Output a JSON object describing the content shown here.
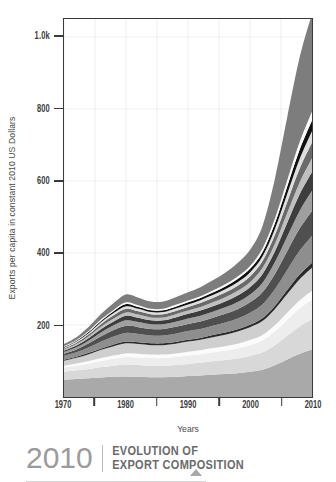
{
  "chart_data": {
    "type": "area",
    "title": "EVOLUTION OF EXPORT COMPOSITION",
    "subtitle": "2010",
    "xlabel": "Years",
    "ylabel": "Exports per capita in constant 2010 US Dollars",
    "xlim": [
      1970,
      2010
    ],
    "ylim": [
      0,
      1050
    ],
    "grid": true,
    "legend": "none",
    "stacked": true,
    "x_tick_labels": [
      "1970",
      "1980",
      "1990",
      "2000",
      "2010"
    ],
    "x_tick_values": [
      1970,
      1980,
      1990,
      2000,
      2010
    ],
    "x_minor_tick_values": [
      1975,
      1985,
      1995,
      2005
    ],
    "y_tick_labels": [
      "200",
      "400",
      "600",
      "800",
      "1.0k"
    ],
    "y_tick_values": [
      200,
      400,
      600,
      800,
      1000
    ],
    "x": [
      1970,
      1972,
      1974,
      1976,
      1978,
      1980,
      1982,
      1984,
      1986,
      1988,
      1990,
      1992,
      1994,
      1996,
      1998,
      2000,
      2002,
      2004,
      2006,
      2008,
      2010
    ],
    "series": [
      {
        "name": "layer-01-base-gray",
        "color": "#a9a9a9",
        "values": [
          48,
          50,
          52,
          54,
          56,
          57,
          56,
          55,
          55,
          56,
          58,
          60,
          62,
          64,
          66,
          70,
          76,
          88,
          104,
          120,
          132
        ]
      },
      {
        "name": "layer-02-light",
        "color": "#d8d8d8",
        "values": [
          22,
          24,
          26,
          29,
          31,
          33,
          33,
          32,
          32,
          33,
          34,
          35,
          37,
          39,
          41,
          44,
          48,
          56,
          66,
          76,
          84
        ]
      },
      {
        "name": "layer-03-pale",
        "color": "#ededed",
        "values": [
          12,
          13,
          15,
          17,
          19,
          21,
          21,
          21,
          21,
          22,
          23,
          24,
          25,
          26,
          28,
          30,
          33,
          38,
          44,
          50,
          55
        ]
      },
      {
        "name": "layer-04-white-stripe",
        "color": "#fbfbfb",
        "values": [
          5,
          6,
          7,
          8,
          9,
          10,
          10,
          10,
          10,
          10,
          11,
          11,
          12,
          12,
          13,
          14,
          15,
          17,
          20,
          22,
          24
        ]
      },
      {
        "name": "layer-05-light-gray",
        "color": "#cfcfcf",
        "values": [
          14,
          16,
          19,
          23,
          26,
          28,
          27,
          26,
          26,
          27,
          28,
          29,
          30,
          32,
          34,
          36,
          39,
          45,
          52,
          59,
          64
        ]
      },
      {
        "name": "layer-06-dark-outline",
        "color": "#2b2b2b",
        "values": [
          3,
          3,
          4,
          4,
          5,
          5,
          5,
          5,
          5,
          5,
          5,
          5,
          6,
          6,
          6,
          7,
          8,
          9,
          11,
          13,
          14
        ]
      },
      {
        "name": "layer-07-mid-gray",
        "color": "#8e8e8e",
        "values": [
          10,
          12,
          15,
          19,
          22,
          24,
          23,
          22,
          22,
          23,
          24,
          25,
          26,
          28,
          30,
          33,
          38,
          46,
          56,
          66,
          74
        ]
      },
      {
        "name": "layer-08-charcoal",
        "color": "#4f4f4f",
        "values": [
          6,
          8,
          11,
          15,
          18,
          20,
          19,
          18,
          18,
          19,
          20,
          21,
          22,
          24,
          26,
          29,
          34,
          42,
          52,
          62,
          70
        ]
      },
      {
        "name": "layer-09-gray",
        "color": "#9f9f9f",
        "values": [
          5,
          6,
          8,
          11,
          13,
          15,
          14,
          13,
          13,
          14,
          15,
          16,
          17,
          18,
          20,
          22,
          26,
          33,
          41,
          49,
          56
        ]
      },
      {
        "name": "layer-10-dark",
        "color": "#3d3d3d",
        "values": [
          4,
          5,
          7,
          9,
          11,
          13,
          12,
          11,
          11,
          12,
          13,
          14,
          15,
          16,
          18,
          20,
          24,
          30,
          38,
          46,
          52
        ]
      },
      {
        "name": "layer-11-silver",
        "color": "#bfbfbf",
        "values": [
          3,
          4,
          5,
          7,
          8,
          9,
          9,
          8,
          8,
          9,
          9,
          10,
          11,
          12,
          13,
          14,
          17,
          21,
          27,
          33,
          38
        ]
      },
      {
        "name": "layer-12-slate",
        "color": "#6a6a6a",
        "values": [
          3,
          4,
          5,
          7,
          9,
          10,
          9,
          9,
          9,
          9,
          10,
          11,
          12,
          13,
          14,
          16,
          19,
          24,
          31,
          38,
          44
        ]
      },
      {
        "name": "layer-13-pale-gray",
        "color": "#dedede",
        "values": [
          2,
          3,
          4,
          5,
          6,
          7,
          7,
          6,
          6,
          7,
          7,
          8,
          8,
          9,
          10,
          11,
          13,
          17,
          22,
          27,
          31
        ]
      },
      {
        "name": "layer-14-black",
        "color": "#111111",
        "values": [
          2,
          2,
          3,
          4,
          5,
          6,
          5,
          5,
          5,
          5,
          6,
          6,
          7,
          8,
          9,
          10,
          12,
          16,
          21,
          26,
          30
        ]
      },
      {
        "name": "layer-15-white-band",
        "color": "#fafafa",
        "values": [
          2,
          2,
          3,
          4,
          4,
          5,
          5,
          4,
          4,
          5,
          5,
          5,
          6,
          6,
          7,
          8,
          10,
          13,
          17,
          21,
          25
        ]
      },
      {
        "name": "layer-16-top-gray",
        "color": "#7d7d7d",
        "values": [
          6,
          8,
          11,
          15,
          19,
          22,
          21,
          20,
          20,
          21,
          23,
          25,
          28,
          32,
          37,
          44,
          62,
          110,
          175,
          235,
          272
        ]
      }
    ]
  },
  "axes": {
    "y_title": "Exports per capita in constant 2010 US Dollars",
    "x_title": "Years"
  },
  "footer": {
    "year": "2010",
    "title_line1": "EVOLUTION OF",
    "title_line2": "EXPORT COMPOSITION"
  },
  "colors": {
    "axis": "#3a3a3a",
    "grid": "#efefef",
    "tick_text": "#3b3b3b",
    "axis_title": "#4a4a4a",
    "footer_year": "#9b9b9b",
    "footer_title": "#6b6b6b",
    "footer_arrow": "#a8a8a8"
  }
}
